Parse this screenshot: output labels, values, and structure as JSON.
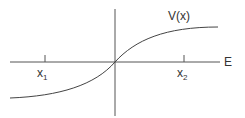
{
  "diagram": {
    "curve_label": "V(x)",
    "axis_label": "E",
    "ticks": [
      {
        "base": "x",
        "sub": "1"
      },
      {
        "base": "x",
        "sub": "2"
      }
    ],
    "colors": {
      "line": "#444444",
      "background": "#ffffff"
    }
  }
}
